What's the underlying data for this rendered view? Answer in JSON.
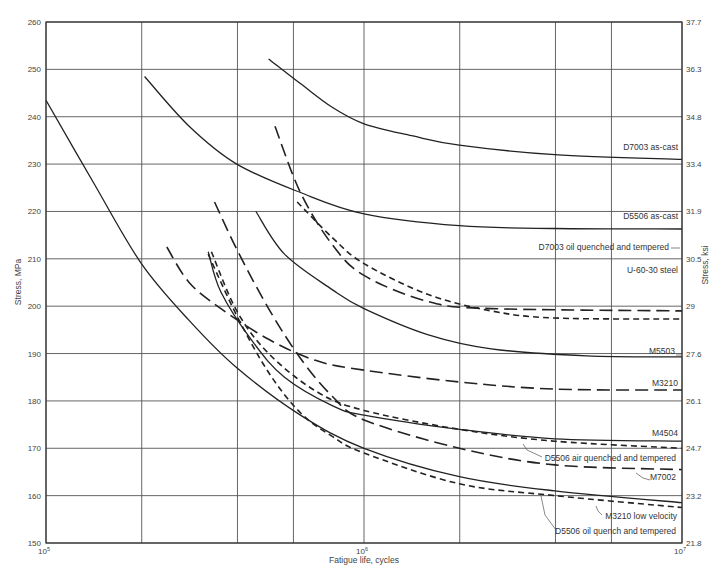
{
  "chart_data": {
    "type": "line",
    "title": "",
    "xlabel": "Fatigue life, cycles",
    "ylabel": "Stress, MPa",
    "ylabel_right": "Stress, ksi",
    "xscale": "log",
    "xlim": [
      100000,
      10000000
    ],
    "ylim": [
      150,
      260
    ],
    "grid": true,
    "legend": "inline labels at right end of curves",
    "x_tick_labels": [
      {
        "value": 100000,
        "label": "10",
        "exp": "5"
      },
      {
        "value": 1000000,
        "label": "10",
        "exp": "6"
      },
      {
        "value": 10000000,
        "label": "10",
        "exp": "7"
      }
    ],
    "x_gridlines": [
      100000,
      200000,
      400000,
      600000,
      1000000,
      2000000,
      4000000,
      6000000,
      10000000
    ],
    "y_ticks_left": [
      150,
      160,
      170,
      180,
      190,
      200,
      210,
      220,
      230,
      240,
      250,
      260
    ],
    "y_ticks_right": [
      "21.8",
      "23.2",
      "24.7",
      "26.1",
      "27.6",
      "29",
      "30.5",
      "31.9",
      "33.4",
      "34.8",
      "36.3",
      "37.7"
    ],
    "series": [
      {
        "name": "D7003 as-cast",
        "style": "solid",
        "points": [
          [
            5.7,
            252.2
          ],
          [
            5.8,
            247
          ],
          [
            5.9,
            242
          ],
          [
            6.0,
            238.5
          ],
          [
            6.15,
            236
          ],
          [
            6.3,
            234
          ],
          [
            6.6,
            232
          ],
          [
            7.0,
            231
          ]
        ]
      },
      {
        "name": "D5506 as-cast",
        "style": "solid",
        "points": [
          [
            5.31,
            248.5
          ],
          [
            5.45,
            238
          ],
          [
            5.6,
            230
          ],
          [
            5.8,
            224
          ],
          [
            6.0,
            219.5
          ],
          [
            6.3,
            217
          ],
          [
            6.6,
            216.4
          ],
          [
            7.0,
            216.3
          ]
        ]
      },
      {
        "name": "D7003 oil quenched and tempered",
        "style": "long-dash",
        "points": [
          [
            5.72,
            238
          ],
          [
            5.8,
            224
          ],
          [
            5.9,
            213
          ],
          [
            6.0,
            206.5
          ],
          [
            6.2,
            201
          ],
          [
            6.4,
            199.5
          ],
          [
            7.0,
            199
          ]
        ]
      },
      {
        "name": "U-60-30 steel",
        "style": "short-dash",
        "points": [
          [
            5.79,
            222
          ],
          [
            5.9,
            214.5
          ],
          [
            6.0,
            209
          ],
          [
            6.2,
            202.5
          ],
          [
            6.4,
            199
          ],
          [
            6.6,
            197.5
          ],
          [
            7.0,
            197.3
          ]
        ]
      },
      {
        "name": "M5503",
        "style": "solid",
        "points": [
          [
            5.66,
            220
          ],
          [
            5.75,
            211
          ],
          [
            5.9,
            203.5
          ],
          [
            6.0,
            199.5
          ],
          [
            6.2,
            194
          ],
          [
            6.4,
            191
          ],
          [
            6.7,
            189.5
          ],
          [
            7.0,
            189.3
          ]
        ]
      },
      {
        "name": "M3210",
        "style": "long-dash",
        "points": [
          [
            5.38,
            212.5
          ],
          [
            5.45,
            205
          ],
          [
            5.55,
            199.5
          ],
          [
            5.7,
            193
          ],
          [
            5.85,
            188.5
          ],
          [
            6.0,
            186.5
          ],
          [
            6.3,
            184
          ],
          [
            6.6,
            182.5
          ],
          [
            7.0,
            182.3
          ]
        ]
      },
      {
        "name": "M4504",
        "style": "solid",
        "points": [
          [
            5.51,
            211.5
          ],
          [
            5.55,
            203
          ],
          [
            5.65,
            192.5
          ],
          [
            5.75,
            185
          ],
          [
            5.9,
            179
          ],
          [
            6.0,
            177
          ],
          [
            6.3,
            174
          ],
          [
            6.6,
            172
          ],
          [
            7.0,
            171.5
          ]
        ]
      },
      {
        "name": "D5506 air quenched and tempered",
        "style": "short-dash",
        "points": [
          [
            5.52,
            211.5
          ],
          [
            5.6,
            199
          ],
          [
            5.7,
            190
          ],
          [
            5.85,
            182
          ],
          [
            6.0,
            178
          ],
          [
            6.3,
            174
          ],
          [
            6.6,
            171.5
          ],
          [
            7.0,
            170
          ]
        ]
      },
      {
        "name": "M7002",
        "style": "long-dash",
        "points": [
          [
            5.53,
            222
          ],
          [
            5.6,
            212
          ],
          [
            5.7,
            199.5
          ],
          [
            5.8,
            189
          ],
          [
            5.9,
            181
          ],
          [
            6.0,
            176
          ],
          [
            6.3,
            170
          ],
          [
            6.6,
            166.5
          ],
          [
            7.0,
            165.5
          ]
        ]
      },
      {
        "name": "M3210 low velocity",
        "style": "solid",
        "points": [
          [
            5.0,
            243.5
          ],
          [
            5.15,
            226
          ],
          [
            5.3,
            209
          ],
          [
            5.45,
            197
          ],
          [
            5.6,
            187
          ],
          [
            5.8,
            177
          ],
          [
            6.0,
            170
          ],
          [
            6.3,
            164
          ],
          [
            6.6,
            161
          ],
          [
            7.0,
            158.5
          ]
        ]
      },
      {
        "name": "D5506 oil quench and tempered",
        "style": "short-dash",
        "points": [
          [
            5.51,
            211
          ],
          [
            5.6,
            198
          ],
          [
            5.7,
            186
          ],
          [
            5.8,
            177.5
          ],
          [
            5.9,
            172.5
          ],
          [
            6.0,
            169
          ],
          [
            6.3,
            162.5
          ],
          [
            6.6,
            160
          ],
          [
            7.0,
            157.5
          ]
        ]
      }
    ],
    "labels": [
      {
        "text": "D7003 as-cast",
        "x": 678,
        "y": 150,
        "anchor": "end"
      },
      {
        "text": "D5506 as-cast",
        "x": 678,
        "y": 219,
        "anchor": "end"
      },
      {
        "text": "D7003 oil quenched and tempered",
        "x": 669,
        "y": 250,
        "anchor": "end",
        "leader": [
          [
            671,
            248
          ],
          [
            680,
            248
          ]
        ]
      },
      {
        "text": "U-60-30 steel",
        "x": 678,
        "y": 273,
        "anchor": "end"
      },
      {
        "text": "M5503",
        "x": 675,
        "y": 354,
        "anchor": "end",
        "leader": [
          [
            676,
            355
          ],
          [
            681,
            355
          ]
        ]
      },
      {
        "text": "M3210",
        "x": 678,
        "y": 386,
        "anchor": "end"
      },
      {
        "text": "M4504",
        "x": 678,
        "y": 436,
        "anchor": "end"
      },
      {
        "text": "D5506 air quenched and tempered",
        "x": 676,
        "y": 461,
        "anchor": "end",
        "leader": [
          [
            523,
            444
          ],
          [
            527,
            450
          ],
          [
            542,
            457
          ]
        ]
      },
      {
        "text": "M7002",
        "x": 676,
        "y": 480,
        "anchor": "end",
        "leader": [
          [
            636,
            473
          ],
          [
            643,
            478
          ],
          [
            650,
            480
          ]
        ]
      },
      {
        "text": "M3210 low velocity",
        "x": 677,
        "y": 519,
        "anchor": "end",
        "leader": [
          [
            596,
            506
          ],
          [
            598,
            511
          ],
          [
            602,
            515
          ]
        ]
      },
      {
        "text": "D5506 oil quench and tempered",
        "x": 676,
        "y": 534,
        "anchor": "end",
        "leader": [
          [
            541,
            496
          ],
          [
            545,
            515
          ],
          [
            556,
            530
          ]
        ]
      }
    ]
  }
}
